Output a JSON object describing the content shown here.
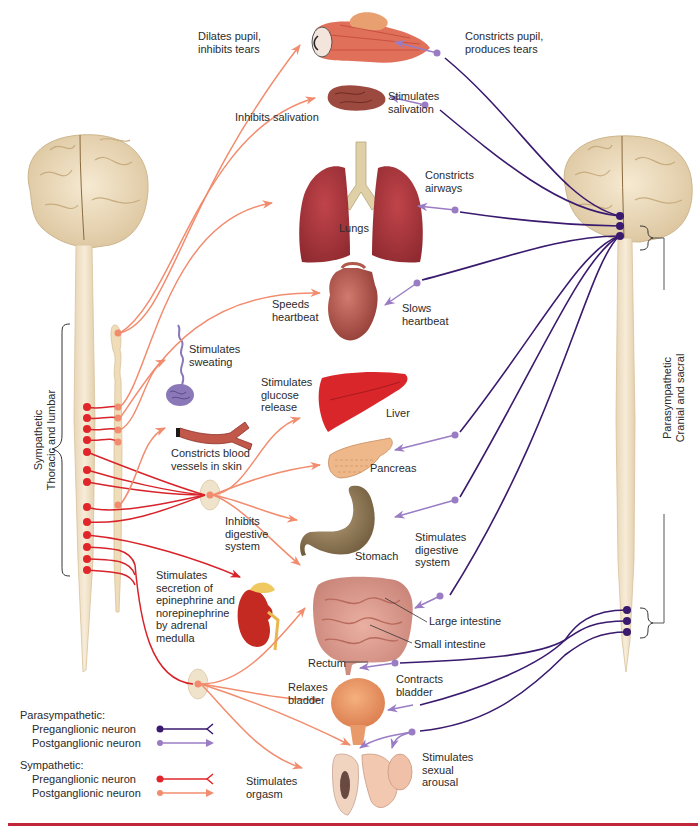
{
  "figure": {
    "colors": {
      "parasym_pre": "#3a1a6e",
      "parasym_post": "#9a7cc4",
      "sym_pre": "#e0262a",
      "sym_post": "#f28c6e",
      "spinal_cord": "#f1e3c8",
      "rule": "#c0283a"
    }
  },
  "divisions": {
    "sympathetic": "Sympathetic\nThoracic and lumbar",
    "parasympathetic": "Parasympathetic\nCranial and sacral"
  },
  "organs": {
    "lungs": "Lungs",
    "liver": "Liver",
    "pancreas": "Pancreas",
    "stomach": "Stomach",
    "large_intestine": "Large intestine",
    "small_intestine": "Small intestine",
    "rectum": "Rectum"
  },
  "sympathetic_effects": {
    "eye": "Dilates pupil,\ninhibits tears",
    "salivary": "Inhibits salivation",
    "heart": "Speeds\nheartbeat",
    "sweat": "Stimulates\nsweating",
    "vessels": "Constricts blood\nvessels in skin",
    "liver": "Stimulates\nglucose\nrelease",
    "digestive": "Inhibits\ndigestive\nsystem",
    "adrenal": "Stimulates\nsecretion of\nepinephrine and\nnorepinephrine\nby adrenal\nmedulla",
    "bladder": "Relaxes\nbladder",
    "genital": "Stimulates\norgasm"
  },
  "parasympathetic_effects": {
    "eye": "Constricts pupil,\nproduces tears",
    "salivary": "Stimulates\nsalivation",
    "airways": "Constricts\nairways",
    "heart": "Slows\nheartbeat",
    "digestive": "Stimulates\ndigestive\nsystem",
    "bladder": "Contracts\nbladder",
    "genital": "Stimulates\nsexual\narousal"
  },
  "legend": {
    "parasympathetic": {
      "title": "Parasympathetic:",
      "pre": "Preganglionic neuron",
      "post": "Postganglionic neuron"
    },
    "sympathetic": {
      "title": "Sympathetic:",
      "pre": "Preganglionic neuron",
      "post": "Postganglionic neuron"
    }
  }
}
